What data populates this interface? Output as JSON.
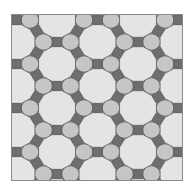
{
  "figure": {
    "type": "tiling",
    "name": "truncated trihexagonal tiling (4.6.12)",
    "frame": {
      "x": 11,
      "y": 14,
      "width": 172,
      "height": 167
    },
    "lattice": {
      "origin": {
        "x": 57,
        "y": 64
      },
      "column_spacing": 40.5,
      "vertical_spacing": 44,
      "edge_length": 9.3
    },
    "colors": {
      "background": "#ffffff",
      "frame": "#8a8a8a",
      "edge": "#5a5a5a",
      "dodecagon": "#e4e4e4",
      "hexagon": "#c6c6c6",
      "square": "#6e6e6e"
    },
    "shapes": [
      "dodecagon",
      "hexagon",
      "square"
    ]
  }
}
